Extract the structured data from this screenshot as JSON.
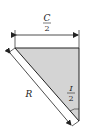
{
  "diagram": {
    "chord_label": {
      "numerator": "C",
      "denominator": "2"
    },
    "radius_label": "R",
    "angle_label": {
      "numerator": "I",
      "denominator": "2"
    },
    "colors": {
      "fill": "#d4d4d4",
      "stroke": "#222222",
      "background": "#ffffff"
    }
  }
}
